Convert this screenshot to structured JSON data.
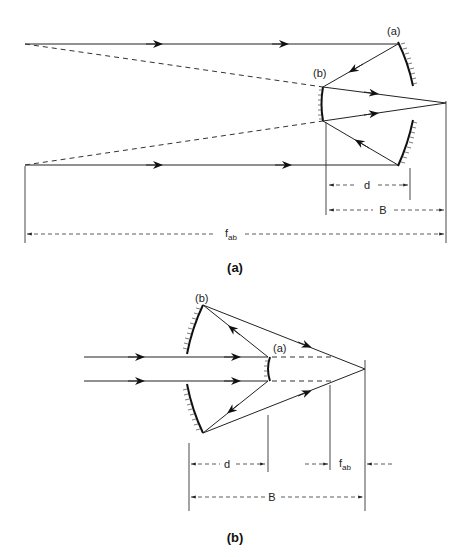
{
  "figure_a": {
    "caption": "(a)",
    "labels": {
      "primary_mirror": "(a)",
      "secondary_mirror": "(b)",
      "d": "d",
      "B": "B",
      "f_main": "f",
      "f_sub": "ab"
    }
  },
  "figure_b": {
    "caption": "(b)",
    "labels": {
      "primary_mirror": "(b)",
      "secondary_mirror": "(a)",
      "d": "d",
      "B": "B",
      "f_main": "f",
      "f_sub": "ab"
    }
  },
  "colors": {
    "line": "#222222",
    "background": "#ffffff"
  }
}
